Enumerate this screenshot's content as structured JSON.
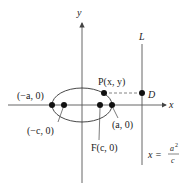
{
  "diagram": {
    "axes": {
      "x_label": "x",
      "y_label": "y"
    },
    "directrix": {
      "label": "L",
      "equation_lhs": "x =",
      "equation_num": "a",
      "equation_sup": "2",
      "equation_den": "c"
    },
    "points": {
      "neg_a": "(−a, 0)",
      "neg_c": "(−c, 0)",
      "focus": "F(c, 0)",
      "pos_a": "(a, 0)",
      "p": "P(x, y)",
      "d": "D"
    },
    "colors": {
      "ink": "#222222",
      "axis": "#555555",
      "dash": "#777777"
    }
  }
}
